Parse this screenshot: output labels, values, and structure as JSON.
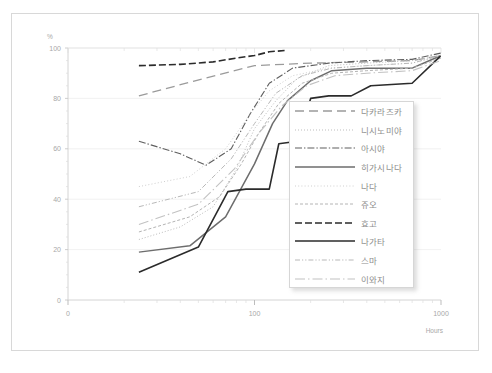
{
  "chart_data": {
    "type": "line",
    "title": "",
    "xlabel": "Hours",
    "ylabel": "%",
    "xscale": "log",
    "xlim": [
      10,
      1000
    ],
    "ylim": [
      0,
      100
    ],
    "xticks": [
      10,
      100,
      1000
    ],
    "xtick_labels": [
      "0",
      "100",
      "1000"
    ],
    "yticks": [
      0,
      20,
      40,
      60,
      80,
      100
    ],
    "ytick_labels": [
      "0",
      "20",
      "40",
      "60",
      "80",
      "100"
    ],
    "grid": true,
    "legend_position": "center-right",
    "series": [
      {
        "name": "다카라즈카",
        "style": "long-dash",
        "color": "#9b9b9b",
        "width": 1.3,
        "points": [
          [
            24,
            81
          ],
          [
            48,
            87
          ],
          [
            100,
            93
          ],
          [
            200,
            94
          ],
          [
            400,
            94.5
          ],
          [
            700,
            95
          ],
          [
            1000,
            97
          ]
        ]
      },
      {
        "name": "니시노미야",
        "style": "fine-dot",
        "color": "#bdbdbd",
        "width": 1.0,
        "points": [
          [
            24,
            24
          ],
          [
            40,
            29
          ],
          [
            60,
            37
          ],
          [
            80,
            52
          ],
          [
            100,
            68
          ],
          [
            130,
            79
          ],
          [
            170,
            88
          ],
          [
            250,
            93
          ],
          [
            400,
            94
          ],
          [
            700,
            95
          ],
          [
            1000,
            97
          ]
        ]
      },
      {
        "name": "아시야",
        "style": "dash-dot",
        "color": "#5e5e5e",
        "width": 1.1,
        "points": [
          [
            24,
            63
          ],
          [
            40,
            58
          ],
          [
            55,
            53.5
          ],
          [
            75,
            60
          ],
          [
            95,
            74
          ],
          [
            120,
            86
          ],
          [
            160,
            92
          ],
          [
            250,
            94
          ],
          [
            400,
            95
          ],
          [
            700,
            95.5
          ],
          [
            1000,
            98
          ]
        ]
      },
      {
        "name": "히가시나다",
        "style": "solid",
        "color": "#6d6d6d",
        "width": 1.5,
        "points": [
          [
            24,
            19
          ],
          [
            45,
            21.5
          ],
          [
            70,
            33
          ],
          [
            100,
            54
          ],
          [
            125,
            70
          ],
          [
            150,
            79
          ],
          [
            200,
            87
          ],
          [
            260,
            91
          ],
          [
            400,
            92
          ],
          [
            700,
            92
          ],
          [
            1000,
            97
          ]
        ]
      },
      {
        "name": "나다",
        "style": "fine-dot-light",
        "color": "#cfcfcf",
        "width": 1.0,
        "points": [
          [
            24,
            45
          ],
          [
            45,
            49
          ],
          [
            70,
            60
          ],
          [
            95,
            74
          ],
          [
            120,
            83
          ],
          [
            160,
            89
          ],
          [
            250,
            92
          ],
          [
            400,
            93
          ],
          [
            700,
            94
          ],
          [
            1000,
            97
          ]
        ]
      },
      {
        "name": "쥬오",
        "style": "small-dash",
        "color": "#b4b4b4",
        "width": 1.0,
        "points": [
          [
            24,
            27
          ],
          [
            45,
            33
          ],
          [
            65,
            41
          ],
          [
            85,
            54
          ],
          [
            105,
            66
          ],
          [
            135,
            78
          ],
          [
            180,
            86
          ],
          [
            260,
            90
          ],
          [
            400,
            91
          ],
          [
            700,
            92
          ],
          [
            1000,
            96
          ]
        ]
      },
      {
        "name": "효고",
        "style": "heavy-dash",
        "color": "#2b2b2b",
        "width": 1.6,
        "points": [
          [
            24,
            93
          ],
          [
            40,
            93.5
          ],
          [
            60,
            94.5
          ],
          [
            80,
            96
          ],
          [
            100,
            97
          ],
          [
            120,
            98.5
          ],
          [
            145,
            99
          ]
        ]
      },
      {
        "name": "나가타",
        "style": "solid-black",
        "color": "#2b2b2b",
        "width": 1.6,
        "points": [
          [
            24,
            11
          ],
          [
            50,
            21
          ],
          [
            72,
            43
          ],
          [
            90,
            44
          ],
          [
            120,
            44
          ],
          [
            135,
            62
          ],
          [
            170,
            63
          ],
          [
            200,
            80
          ],
          [
            250,
            81
          ],
          [
            330,
            81
          ],
          [
            420,
            85
          ],
          [
            700,
            86
          ],
          [
            1000,
            97
          ]
        ]
      },
      {
        "name": "스마",
        "style": "dash-dot-dot",
        "color": "#b8b8b8",
        "width": 1.0,
        "points": [
          [
            24,
            37
          ],
          [
            50,
            43
          ],
          [
            75,
            56
          ],
          [
            100,
            70
          ],
          [
            130,
            82
          ],
          [
            180,
            89
          ],
          [
            260,
            92
          ],
          [
            400,
            93
          ],
          [
            700,
            94
          ],
          [
            1000,
            97
          ]
        ]
      },
      {
        "name": "이와지",
        "style": "long-dash-dot",
        "color": "#c2c2c2",
        "width": 1.1,
        "points": [
          [
            24,
            30
          ],
          [
            50,
            38
          ],
          [
            78,
            52
          ],
          [
            105,
            66
          ],
          [
            140,
            77
          ],
          [
            190,
            85
          ],
          [
            270,
            89
          ],
          [
            400,
            90
          ],
          [
            700,
            91
          ],
          [
            1000,
            95
          ]
        ]
      }
    ]
  }
}
